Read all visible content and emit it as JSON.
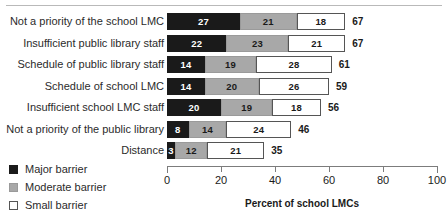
{
  "chart_data": {
    "type": "bar",
    "orientation": "horizontal",
    "stacked": true,
    "title": "",
    "xlabel": "Percent of school LMCs",
    "ylabel": "",
    "xlim": [
      0,
      100
    ],
    "xticks": [
      0,
      20,
      40,
      60,
      80,
      100
    ],
    "xtick_labels": [
      "0",
      "20",
      "40",
      "60",
      "80",
      "100"
    ],
    "grid": false,
    "legend_position": "bottom-left",
    "categories": [
      "Not a priority of the school LMC",
      "Insufficient public library staff",
      "Schedule of public library staff",
      "Schedule of school LMC",
      "Insufficient school LMC staff",
      "Not a priority of the public library",
      "Distance"
    ],
    "series": [
      {
        "name": "Major barrier",
        "color": "#1a1a1a",
        "values": [
          27,
          22,
          14,
          14,
          20,
          8,
          3
        ]
      },
      {
        "name": "Moderate barrier",
        "color": "#a8a8a8",
        "values": [
          21,
          23,
          19,
          20,
          19,
          14,
          12
        ]
      },
      {
        "name": "Small barrier",
        "color": "#ffffff",
        "values": [
          18,
          21,
          28,
          26,
          18,
          24,
          21
        ]
      }
    ],
    "totals": [
      67,
      67,
      61,
      59,
      56,
      46,
      35
    ]
  },
  "legend": {
    "items": [
      {
        "label": "Major barrier",
        "swatch": "major"
      },
      {
        "label": "Moderate barrier",
        "swatch": "moderate"
      },
      {
        "label": "Small barrier",
        "swatch": "small"
      }
    ]
  },
  "axis": {
    "title": "Percent of school LMCs"
  }
}
